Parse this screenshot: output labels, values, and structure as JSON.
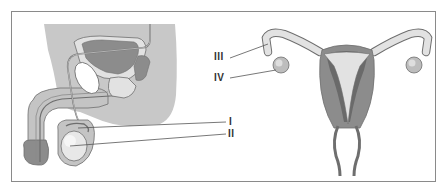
{
  "diagram": {
    "type": "anatomical-illustration",
    "panels": [
      {
        "name": "male-reproductive-system",
        "labels": [
          "I",
          "II"
        ]
      },
      {
        "name": "female-reproductive-system",
        "labels": [
          "III",
          "IV"
        ]
      }
    ],
    "labels": {
      "I": "I",
      "II": "II",
      "III": "III",
      "IV": "IV"
    },
    "colors": {
      "border": "#8a8a8a",
      "body_fill": "#c8c8c8",
      "organ_dark": "#8c8c8c",
      "organ_light": "#e2e2e2",
      "outline": "#6e6e6e",
      "label_text": "#333333"
    }
  }
}
